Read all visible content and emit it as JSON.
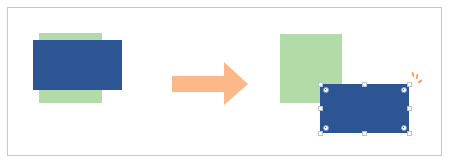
{
  "diagram": {
    "colors": {
      "background": "#ffffff",
      "frame_border": "#c8c8c8",
      "green_rect": "#b3dba8",
      "blue_rect": "#2e5593",
      "arrow": "#fdb88a",
      "sparkle": "#f0a36a",
      "handle_fill": "#ffffff",
      "handle_border": "#b9c3d6"
    },
    "before": {
      "green_rect": {
        "x": 39,
        "y": 33,
        "w": 63,
        "h": 70
      },
      "blue_rect": {
        "x": 33,
        "y": 40,
        "w": 89,
        "h": 50
      }
    },
    "arrow": {
      "direction": "right",
      "x": 172,
      "y": 62,
      "w": 76,
      "h": 43
    },
    "after": {
      "green_rect": {
        "x": 280,
        "y": 34,
        "w": 62,
        "h": 69
      },
      "blue_rect": {
        "x": 320,
        "y": 84,
        "w": 89,
        "h": 49,
        "selected": true,
        "handles": 8,
        "rotation_markers": 4
      }
    }
  }
}
